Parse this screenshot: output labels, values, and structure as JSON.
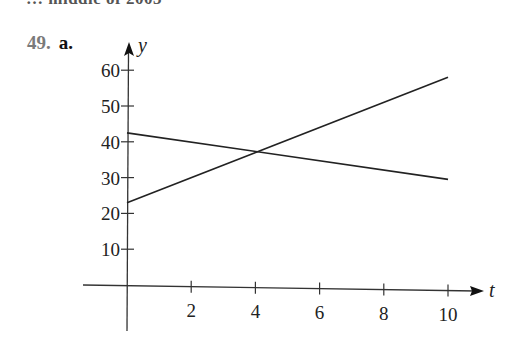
{
  "header": {
    "clipped_text": "… middle of 2003",
    "problem_number": "49.",
    "part": "a."
  },
  "chart_data": {
    "type": "line",
    "title": "",
    "xlabel": "t",
    "ylabel": "y",
    "xlim": [
      0,
      10
    ],
    "ylim": [
      0,
      60
    ],
    "x_ticks": [
      2,
      4,
      6,
      8,
      10
    ],
    "y_ticks": [
      10,
      20,
      30,
      40,
      50,
      60
    ],
    "x_tick_labels": [
      "2",
      "4",
      "6",
      "8",
      "10"
    ],
    "y_tick_labels": [
      "10",
      "20",
      "30",
      "40",
      "50",
      "60"
    ],
    "grid": false,
    "legend": null,
    "series": [
      {
        "name": "increasing line",
        "x": [
          0,
          10
        ],
        "values": [
          23,
          58
        ]
      },
      {
        "name": "decreasing line",
        "x": [
          0,
          10
        ],
        "values": [
          42.5,
          29.5
        ]
      }
    ],
    "annotations": [
      {
        "text": "intersection",
        "x": 4.1,
        "y": 37.3
      }
    ]
  },
  "colors": {
    "line": "#222222",
    "axis": "#333333",
    "problem_number": "#7a7a7a"
  }
}
